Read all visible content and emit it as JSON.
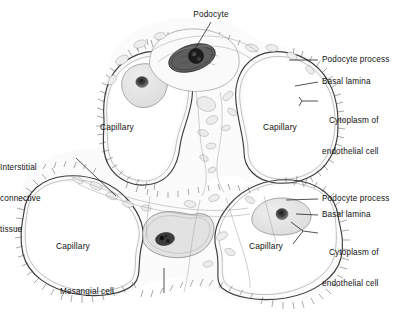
{
  "figure": {
    "kind": "histology-diagram",
    "background_color": "#ffffff",
    "ink_color": "#333333",
    "text_color": "#111111"
  },
  "labels": {
    "podocyte": "Podocyte",
    "podocyte_process_top": "Podocyte process",
    "basal_lamina_top": "Basal lamina",
    "cytoplasm_endothelial_top_line1": "Cytoplasm of",
    "cytoplasm_endothelial_top_line2": "endothelial cell",
    "podocyte_process_bottom": "Podocyte process",
    "basal_lamina_bottom": "Basal lamina",
    "cytoplasm_endothelial_bottom_line1": "Cytoplasm of",
    "cytoplasm_endothelial_bottom_line2": "endothelial cell",
    "interstitial_line1": "Interstitial",
    "interstitial_line2": "connective",
    "interstitial_line3": "tissue",
    "mesangial_cell": "Mesangial cell",
    "capillary_top_left": "Capillary",
    "capillary_top_right": "Capillary",
    "capillary_bottom_left": "Capillary",
    "capillary_bottom_right": "Capillary"
  },
  "structures": [
    {
      "name": "capillary-top-left",
      "type": "capillary-lumen",
      "label": "Capillary"
    },
    {
      "name": "capillary-top-right",
      "type": "capillary-lumen",
      "label": "Capillary"
    },
    {
      "name": "capillary-bottom-left",
      "type": "capillary-lumen",
      "label": "Capillary"
    },
    {
      "name": "capillary-bottom-right",
      "type": "capillary-lumen",
      "label": "Capillary"
    },
    {
      "name": "podocyte-cell-body",
      "type": "cell",
      "label": "Podocyte"
    },
    {
      "name": "mesangial-cell-body",
      "type": "cell",
      "label": "Mesangial cell"
    },
    {
      "name": "interstitial-connective-tissue",
      "type": "tissue",
      "label": "Interstitial connective tissue"
    },
    {
      "name": "basal-lamina",
      "type": "membrane",
      "label": "Basal lamina"
    },
    {
      "name": "podocyte-foot-processes",
      "type": "membrane",
      "label": "Podocyte process"
    },
    {
      "name": "endothelial-cytoplasm",
      "type": "cytoplasm",
      "label": "Cytoplasm of endothelial cell"
    }
  ]
}
